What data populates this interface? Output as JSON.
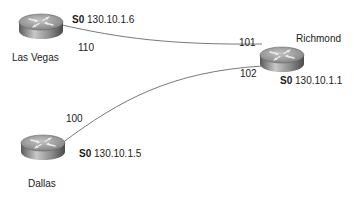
{
  "routers": [
    {
      "id": "las-vegas",
      "name": "Las Vegas",
      "interface": "S0",
      "ip": "130.10.1.6"
    },
    {
      "id": "richmond",
      "name": "Richmond",
      "interface": "S0",
      "ip": "130.10.1.1"
    },
    {
      "id": "dallas",
      "name": "Dallas",
      "interface": "S0",
      "ip": "130.10.1.5"
    }
  ],
  "links": [
    {
      "from": "las-vegas",
      "to": "richmond",
      "from_dlci": "110",
      "to_dlci": "101"
    },
    {
      "from": "dallas",
      "to": "richmond",
      "from_dlci": "100",
      "to_dlci": "102"
    }
  ],
  "colors": {
    "line": "#555555",
    "router_top": "#9a9a9a",
    "router_side": "#6e6e6e",
    "text": "#1a1a1a"
  }
}
